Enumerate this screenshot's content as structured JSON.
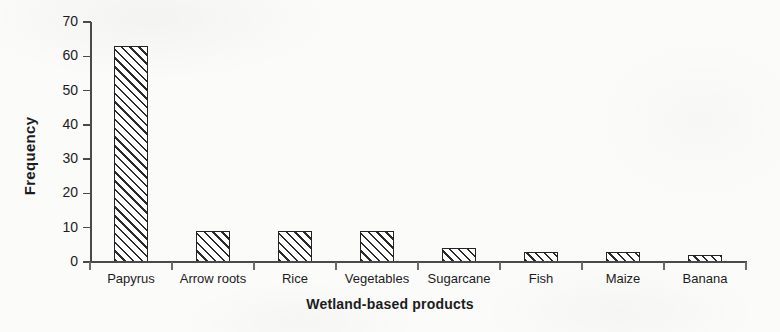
{
  "chart_data": {
    "type": "bar",
    "title": "",
    "xlabel": "Wetland-based products",
    "ylabel": "Frequency",
    "categories": [
      "Papyrus",
      "Arrow roots",
      "Rice",
      "Vegetables",
      "Sugarcane",
      "Fish",
      "Maize",
      "Banana"
    ],
    "values": [
      63,
      9,
      9,
      9,
      4,
      3,
      3,
      2
    ],
    "ylim": [
      0,
      70
    ],
    "ytick_labels": [
      "0",
      "10",
      "20",
      "30",
      "40",
      "50",
      "60",
      "70"
    ],
    "ytick_values": [
      0,
      10,
      20,
      30,
      40,
      50,
      60,
      70
    ],
    "grid": false,
    "legend": false,
    "legend_position": "none",
    "bar_fill": "#ffffff",
    "bar_edge_color": "#242424",
    "bar_hatch": "diagonal-forward",
    "axis_color": "#4a4a4a",
    "text_color": "#1c1c1c",
    "background": "#fbfbfa"
  }
}
